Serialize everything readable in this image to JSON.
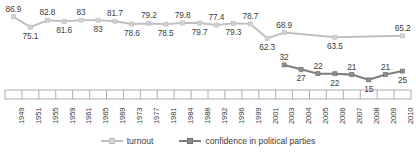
{
  "chart_data": {
    "type": "line",
    "title": "",
    "subtitle": "",
    "xlabel": "",
    "ylabel": "",
    "grid": false,
    "legend_position": "bottom",
    "ylim": [
      0,
      100
    ],
    "categories": [
      "1949",
      "1951",
      "1955",
      "1959",
      "1961",
      "1965",
      "1969",
      "1973",
      "1977",
      "1981",
      "1984",
      "1988",
      "1992",
      "1996",
      "1999",
      "2001",
      "2003",
      "2004",
      "2005",
      "2006",
      "2007",
      "2008",
      "2009",
      "2010"
    ],
    "series": [
      {
        "name": "turnout",
        "color": "#bfbfbf",
        "marker": "square",
        "x": [
          "1949",
          "1951",
          "1955",
          "1959",
          "1961",
          "1965",
          "1969",
          "1973",
          "1977",
          "1981",
          "1984",
          "1988",
          "1992",
          "1996",
          "1999",
          "2001",
          "2003",
          "2006",
          "2010"
        ],
        "values": [
          86.9,
          75.1,
          82.8,
          81.6,
          83,
          83,
          81.7,
          78.6,
          79.2,
          78.5,
          79.8,
          79.7,
          77.4,
          79.3,
          78.7,
          62.3,
          68.9,
          63.5,
          65.2
        ],
        "labels": [
          "86.9",
          "75.1",
          "82.8",
          "81.6",
          "83",
          "83",
          "81.7",
          "78.6",
          "79.2",
          "78.5",
          "79.8",
          "79.7",
          "77.4",
          "79.3",
          "78.7",
          "62.3",
          "68.9",
          "63.5",
          "65.2"
        ]
      },
      {
        "name": "confidence in political parties",
        "color": "#7f7f7f",
        "marker": "square",
        "x": [
          "2003",
          "2004",
          "2005",
          "2006",
          "2007",
          "2008",
          "2009",
          "2010"
        ],
        "values": [
          32,
          27,
          22,
          22,
          21,
          15,
          21,
          25
        ],
        "labels": [
          "32",
          "27",
          "22",
          "22",
          "21",
          "15",
          "21",
          "25"
        ]
      }
    ],
    "legend": [
      "turnout",
      "confidence in political parties"
    ]
  }
}
